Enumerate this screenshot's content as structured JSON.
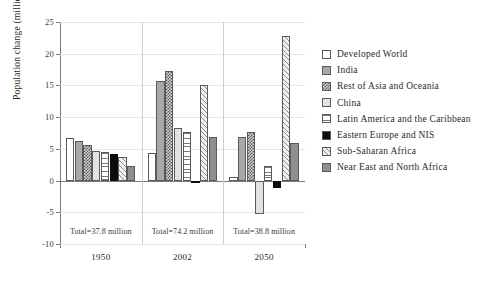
{
  "chart_data": {
    "type": "bar",
    "title": "",
    "subtitle": "",
    "xlabel": "",
    "ylabel": "Population change (millions)",
    "categories": [
      "1950",
      "2002",
      "2050"
    ],
    "group_annotations": [
      "Total=37.8 million",
      "Total=74.2 million",
      "Total=38.8 million"
    ],
    "ylim": [
      -10,
      25
    ],
    "yticks": [
      -10,
      -5,
      0,
      5,
      10,
      15,
      20,
      25
    ],
    "ytick_labels": [
      "-10",
      "-5",
      "0",
      "5",
      "10",
      "15",
      "20",
      "25"
    ],
    "grid": true,
    "legend_position": "right",
    "series": [
      {
        "name": "Developed World",
        "pattern": "white",
        "values": [
          6.7,
          4.3,
          0.6
        ]
      },
      {
        "name": "India",
        "pattern": "midgray",
        "values": [
          6.3,
          15.7,
          6.9
        ]
      },
      {
        "name": "Rest of Asia and Oceania",
        "pattern": "checker",
        "values": [
          5.6,
          17.2,
          7.7
        ]
      },
      {
        "name": "China",
        "pattern": "ltgray",
        "values": [
          4.6,
          8.3,
          -5.3
        ]
      },
      {
        "name": "Latin America and the Caribbean",
        "pattern": "hlines",
        "values": [
          4.5,
          7.6,
          2.3
        ]
      },
      {
        "name": "Eastern Europe and NIS",
        "pattern": "black",
        "values": [
          4.2,
          -0.4,
          -1.2
        ]
      },
      {
        "name": "Sub-Saharan Africa",
        "pattern": "diag",
        "values": [
          3.7,
          15.1,
          22.8
        ]
      },
      {
        "name": "Near East and North Africa",
        "pattern": "darkgray",
        "values": [
          2.3,
          6.8,
          6.0
        ]
      }
    ]
  },
  "colors": {
    "axis": "#7a7a7a",
    "grid": "#e6e6e6",
    "separator": "#cfcfcf",
    "text": "#2a2a2a",
    "background": "#ffffff"
  }
}
